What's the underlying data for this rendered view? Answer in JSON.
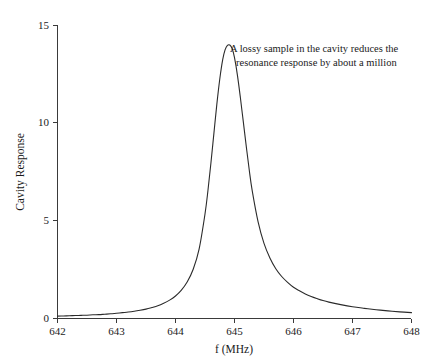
{
  "chart_data": {
    "type": "line",
    "title": "",
    "xlabel": "f (MHz)",
    "ylabel": "Cavity Response",
    "xlim": [
      642,
      648
    ],
    "ylim": [
      0,
      15
    ],
    "grid": false,
    "legend": false,
    "xticks": [
      642,
      643,
      644,
      645,
      646,
      647,
      648
    ],
    "xtick_labels": [
      "642",
      "643",
      "644",
      "645",
      "646",
      "647",
      "648"
    ],
    "yticks": [
      0,
      5,
      10,
      15
    ],
    "ytick_labels": [
      "0",
      "5",
      "10",
      "15"
    ],
    "annotations": [
      {
        "lines": [
          "A lossy sample in the cavity reduces the",
          "resonance response by about a million"
        ],
        "x": 645.05,
        "y": 13.9
      }
    ],
    "series": [
      {
        "name": "Cavity Response",
        "color": "#2b2b2b",
        "peak_x": 644.92,
        "peak_y": 14.0,
        "fwhm": 0.47,
        "baseline": 0.05,
        "x": [
          642.0,
          642.1,
          642.2,
          642.3,
          642.4,
          642.5,
          642.6,
          642.7,
          642.8,
          642.9,
          643.0,
          643.1,
          643.2,
          643.3,
          643.4,
          643.5,
          643.6,
          643.7,
          643.8,
          643.9,
          644.0,
          644.1,
          644.2,
          644.3,
          644.4,
          644.5,
          644.55,
          644.6,
          644.65,
          644.7,
          644.75,
          644.8,
          644.84,
          644.88,
          644.92,
          644.96,
          645.0,
          645.05,
          645.1,
          645.15,
          645.2,
          645.25,
          645.3,
          645.4,
          645.5,
          645.6,
          645.7,
          645.8,
          645.9,
          646.0,
          646.1,
          646.2,
          646.3,
          646.4,
          646.5,
          646.6,
          646.8,
          647.0,
          647.2,
          647.4,
          647.6,
          647.8,
          648.0
        ],
        "y": [
          0.12,
          0.13,
          0.14,
          0.15,
          0.16,
          0.17,
          0.19,
          0.2,
          0.22,
          0.24,
          0.27,
          0.3,
          0.33,
          0.37,
          0.42,
          0.48,
          0.56,
          0.65,
          0.78,
          0.94,
          1.15,
          1.45,
          1.88,
          2.52,
          3.55,
          5.35,
          6.55,
          7.95,
          9.45,
          10.95,
          12.25,
          13.25,
          13.75,
          13.98,
          14.0,
          13.82,
          13.35,
          12.45,
          11.3,
          10.05,
          8.8,
          7.6,
          6.55,
          4.95,
          3.85,
          3.1,
          2.55,
          2.15,
          1.85,
          1.6,
          1.42,
          1.26,
          1.13,
          1.02,
          0.92,
          0.84,
          0.71,
          0.6,
          0.52,
          0.45,
          0.39,
          0.34,
          0.3
        ]
      }
    ]
  },
  "figure": {
    "background_color": "#ffffff",
    "line_color": "#2b2b2b",
    "axis_color": "#3a3a3a",
    "text_color": "#1a1a1a"
  }
}
